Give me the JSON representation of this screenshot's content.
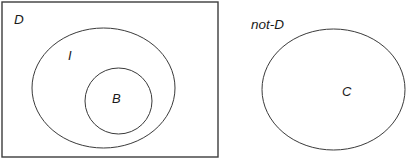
{
  "diagram": {
    "type": "venn-euler-diagram",
    "background_color": "#ffffff",
    "stroke_color": "#3a3a3a",
    "label_color": "#1a1a1a",
    "universe": {
      "label": "D",
      "shape": "rectangle",
      "x": 2,
      "y": 2,
      "width": 216,
      "height": 155,
      "label_x": 14,
      "label_y": 24
    },
    "sets": [
      {
        "label": "I",
        "shape": "ellipse",
        "cx": 103.5,
        "cy": 88,
        "rx": 71.5,
        "ry": 60,
        "label_x": 68,
        "label_y": 60
      },
      {
        "label": "B",
        "shape": "circle",
        "cx": 118.5,
        "cy": 101,
        "rx": 33.5,
        "ry": 33,
        "label_x": 112,
        "label_y": 103
      },
      {
        "label": "C",
        "shape": "ellipse",
        "cx": 333.5,
        "cy": 89.5,
        "rx": 71.5,
        "ry": 60.5,
        "label_x": 342,
        "label_y": 96
      }
    ],
    "outside_label": {
      "label": "not-D",
      "label_x": 251,
      "label_y": 29
    }
  }
}
